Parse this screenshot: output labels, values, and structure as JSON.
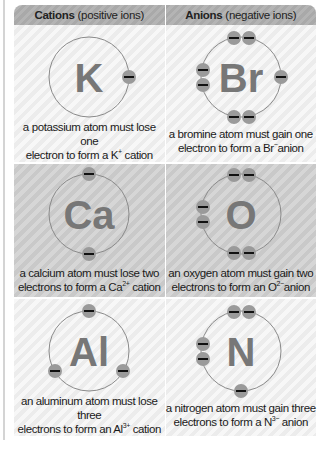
{
  "header": {
    "cations": {
      "bold": "Cations",
      "rest": "(positive ions)"
    },
    "anions": {
      "bold": "Anions",
      "rest": "(negative ions)"
    }
  },
  "rows": [
    {
      "cation": {
        "symbol": "K",
        "line1": "a potassium atom must lose one",
        "line2_pre": "electron to form a K",
        "charge": "+",
        "line2_post": " cation"
      },
      "anion": {
        "symbol": "Br",
        "line1": "a bromine atom must gain one",
        "line2_pre": "electron to form a Br",
        "charge": "−",
        "line2_post": "anion"
      }
    },
    {
      "cation": {
        "symbol": "Ca",
        "line1": "a calcium atom must lose two",
        "line2_pre": "electrons to form a Ca",
        "charge": "2+",
        "line2_post": " cation"
      },
      "anion": {
        "symbol": "O",
        "line1": "an oxygen atom must gain two",
        "line2_pre": "electrons to form an O",
        "charge": "2−",
        "line2_post": "anion"
      }
    },
    {
      "cation": {
        "symbol": "Al",
        "line1": "an aluminum atom must lose three",
        "line2_pre": "electrons to form an Al",
        "charge": "3+",
        "line2_post": " cation"
      },
      "anion": {
        "symbol": "N",
        "line1": "a nitrogen atom must gain three",
        "line2_pre": "electrons to form a N",
        "charge": "3−",
        "line2_post": " anion"
      }
    }
  ],
  "colors": {
    "symbol": "#777777",
    "electron": "#9a9a9a",
    "orbit": "#8a8a8a"
  }
}
